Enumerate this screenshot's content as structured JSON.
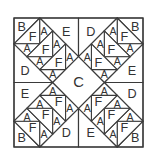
{
  "diagram": {
    "grid_units": 10,
    "colors": {
      "line": "#3a3a3a",
      "text": "#333333",
      "fill": "#ffffff"
    },
    "center_piece": {
      "label": "C",
      "points": [
        [
          5,
          3
        ],
        [
          7,
          5
        ],
        [
          5,
          7
        ],
        [
          3,
          5
        ]
      ]
    },
    "dividers": [
      {
        "from": [
          5,
          0
        ],
        "to": [
          5,
          3
        ]
      },
      {
        "from": [
          5,
          7
        ],
        "to": [
          5,
          10
        ]
      },
      {
        "from": [
          0,
          5
        ],
        "to": [
          3,
          5
        ]
      },
      {
        "from": [
          7,
          5
        ],
        "to": [
          10,
          5
        ]
      }
    ],
    "base_quadrant_pieces": [
      {
        "id": "corner",
        "type": "B",
        "points": [
          [
            0,
            0
          ],
          [
            2,
            0
          ],
          [
            0,
            2
          ]
        ],
        "label_pos": [
          0.6,
          0.7
        ]
      },
      {
        "id": "side_top",
        "type": "E",
        "points": [
          [
            2,
            0
          ],
          [
            5,
            0
          ],
          [
            5,
            3
          ]
        ],
        "label_pos": [
          4.05,
          1.1
        ]
      },
      {
        "id": "side_left",
        "type": "D",
        "points": [
          [
            0,
            2
          ],
          [
            0,
            5
          ],
          [
            3,
            5
          ]
        ],
        "label_pos": [
          0.85,
          4.1
        ]
      },
      {
        "id": "f0",
        "type": "F",
        "points": [
          [
            2,
            0
          ],
          [
            2,
            2
          ],
          [
            0,
            2
          ]
        ],
        "label_pos": [
          1.45,
          1.45
        ]
      },
      {
        "id": "ar0",
        "type": "A",
        "points": [
          [
            2,
            0
          ],
          [
            2,
            2
          ],
          [
            3,
            1
          ]
        ],
        "label_pos": [
          2.32,
          1.0
        ]
      },
      {
        "id": "ab0",
        "type": "A",
        "points": [
          [
            0,
            2
          ],
          [
            2,
            2
          ],
          [
            1,
            3
          ]
        ],
        "label_pos": [
          1.0,
          2.32
        ]
      },
      {
        "id": "f1",
        "type": "F",
        "points": [
          [
            1,
            3
          ],
          [
            3,
            1
          ],
          [
            3,
            3
          ]
        ],
        "label_pos": [
          2.45,
          2.45
        ]
      },
      {
        "id": "ar1",
        "type": "A",
        "points": [
          [
            3,
            1
          ],
          [
            3,
            3
          ],
          [
            4,
            2
          ]
        ],
        "label_pos": [
          3.32,
          2.0
        ]
      },
      {
        "id": "ab1",
        "type": "A",
        "points": [
          [
            1,
            3
          ],
          [
            3,
            3
          ],
          [
            2,
            4
          ]
        ],
        "label_pos": [
          2.0,
          3.32
        ]
      },
      {
        "id": "f2",
        "type": "F",
        "points": [
          [
            2,
            4
          ],
          [
            4,
            2
          ],
          [
            4,
            4
          ]
        ],
        "label_pos": [
          3.45,
          3.45
        ]
      },
      {
        "id": "ar2",
        "type": "A",
        "points": [
          [
            4,
            2
          ],
          [
            4,
            4
          ],
          [
            5,
            3
          ]
        ],
        "label_pos": [
          4.32,
          3.0
        ]
      },
      {
        "id": "ab2",
        "type": "A",
        "points": [
          [
            2,
            4
          ],
          [
            4,
            4
          ],
          [
            3,
            5
          ]
        ],
        "label_pos": [
          3.0,
          4.32
        ]
      }
    ],
    "quadrants": [
      {
        "name": "top-left",
        "flip_x": false,
        "flip_y": false,
        "labels": {
          "corner": "B",
          "side_top": "E",
          "side_left": "D",
          "F": "F",
          "A": "A"
        }
      },
      {
        "name": "top-right",
        "flip_x": true,
        "flip_y": false,
        "labels": {
          "corner": "B",
          "side_top": "D",
          "side_left": "E",
          "F": "F",
          "A": "A"
        }
      },
      {
        "name": "bottom-left",
        "flip_x": false,
        "flip_y": true,
        "labels": {
          "corner": "B",
          "side_top": "D",
          "side_left": "E",
          "F": "F",
          "A": "A"
        }
      },
      {
        "name": "bottom-right",
        "flip_x": true,
        "flip_y": true,
        "labels": {
          "corner": "B",
          "side_top": "E",
          "side_left": "D",
          "F": "F",
          "A": "A"
        }
      }
    ],
    "piece_legend": [
      "A",
      "B",
      "C",
      "D",
      "E",
      "F"
    ]
  }
}
